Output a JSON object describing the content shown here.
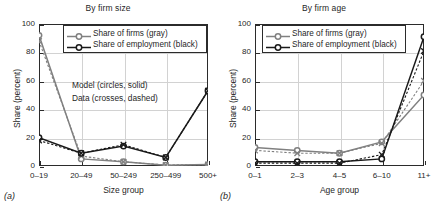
{
  "figure": {
    "width": 432,
    "height": 218,
    "background": "#ffffff"
  },
  "colors": {
    "model_firms_gray": "#808080",
    "model_employment_black": "#1a1a1a",
    "axis": "#2b2b2b",
    "grid": "#d2d2d2"
  },
  "panels": [
    {
      "tag": "(a)",
      "title": "By firm size",
      "xlabel": "Size group",
      "ylabel": "Share (percent)",
      "yticks": [
        "0",
        "20",
        "40",
        "60",
        "80",
        "100"
      ],
      "xticks": [
        "0–19",
        "20–49",
        "50–249",
        "250–499",
        "500+"
      ],
      "legend": [
        "Share of firms (gray)",
        "Share of employment (black)"
      ],
      "annotations": [
        "Model (circles, solid)",
        "Data (crosses, dashed)"
      ]
    },
    {
      "tag": "(b)",
      "title": "By firm age",
      "xlabel": "Age group",
      "ylabel": "Share (percent)",
      "yticks": [
        "0",
        "20",
        "40",
        "60",
        "80",
        "100"
      ],
      "xticks": [
        "0–1",
        "2–3",
        "4–5",
        "6–10",
        "11+"
      ],
      "legend": [
        "Share of firms (gray)",
        "Share of employment (black)"
      ],
      "annotations": []
    }
  ],
  "chart_data": [
    {
      "type": "line",
      "title": "By firm size",
      "xlabel": "Size group",
      "ylabel": "Share (percent)",
      "categories": [
        "0–19",
        "20–49",
        "50–249",
        "250–499",
        "500+"
      ],
      "ylim": [
        0,
        100
      ],
      "xlim": [
        0,
        4
      ],
      "grid": true,
      "legend_position": "top-center-inside",
      "annotations": [
        "Model (circles, solid)",
        "Data (crosses, dashed)"
      ],
      "series": [
        {
          "name": "Share of firms (gray) — Model",
          "color": "#808080",
          "marker": "circle",
          "linestyle": "solid",
          "values": [
            92,
            5,
            3,
            0.5,
            1
          ]
        },
        {
          "name": "Share of firms (gray) — Data",
          "color": "#808080",
          "marker": "cross",
          "linestyle": "dashed",
          "values": [
            88,
            7,
            3,
            0.7,
            1
          ]
        },
        {
          "name": "Share of employment (black) — Model",
          "color": "#1a1a1a",
          "marker": "circle",
          "linestyle": "solid",
          "values": [
            20,
            9,
            14,
            6,
            53
          ]
        },
        {
          "name": "Share of employment (black) — Data",
          "color": "#1a1a1a",
          "marker": "cross",
          "linestyle": "dashed",
          "values": [
            18,
            9,
            15,
            6,
            53
          ]
        }
      ]
    },
    {
      "type": "line",
      "title": "By firm age",
      "xlabel": "Age group",
      "ylabel": "Share (percent)",
      "categories": [
        "0–1",
        "2–3",
        "4–5",
        "6–10",
        "11+"
      ],
      "ylim": [
        0,
        100
      ],
      "xlim": [
        0,
        4
      ],
      "grid": true,
      "legend_position": "top-left-inside",
      "annotations": [],
      "series": [
        {
          "name": "Share of firms (gray) — Model",
          "color": "#808080",
          "marker": "circle",
          "linestyle": "solid",
          "values": [
            13,
            11,
            9,
            17,
            50
          ]
        },
        {
          "name": "Share of firms (gray) — Data",
          "color": "#808080",
          "marker": "cross",
          "linestyle": "dashed",
          "values": [
            11,
            9,
            9,
            16,
            60
          ]
        },
        {
          "name": "Share of employment (black) — Model",
          "color": "#1a1a1a",
          "marker": "circle",
          "linestyle": "solid",
          "values": [
            3,
            3,
            3,
            5,
            91
          ]
        },
        {
          "name": "Share of employment (black) — Data",
          "color": "#1a1a1a",
          "marker": "cross",
          "linestyle": "dashed",
          "values": [
            2,
            2,
            2,
            8,
            81
          ]
        }
      ]
    }
  ]
}
